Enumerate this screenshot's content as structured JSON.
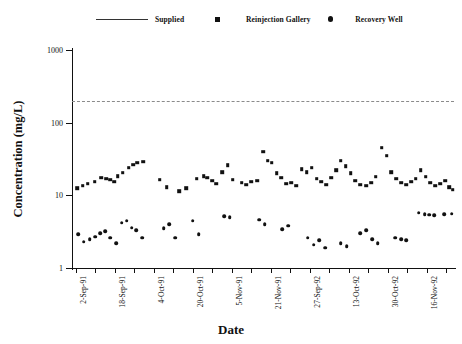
{
  "chart_data": {
    "type": "scatter",
    "title": "",
    "xlabel": "Date",
    "ylabel": "Concentration (mg/L)",
    "yscale": "log",
    "ylim": [
      1,
      1000
    ],
    "ytick_labels": [
      "1000",
      "100",
      "10",
      "1"
    ],
    "ytick_values": [
      1000,
      100,
      10,
      1
    ],
    "grid": false,
    "legend_position": "top",
    "xtick_labels": [
      "2-Sep-91",
      "18-Sep-91",
      "4-Oct-91",
      "20-Oct-91",
      "5-Nov-91",
      "21-Nov-91",
      "27-Sep-92",
      "13-Oct-92",
      "30-Oct-92",
      "16-Nov-92"
    ],
    "xlim_index": [
      0,
      19
    ],
    "annotations": [],
    "series": [
      {
        "name": "Supplied",
        "marker": "line",
        "style": "dashed",
        "color": "#8b8b8b",
        "constant_value": 200
      },
      {
        "name": "Reinjection Gallery",
        "marker": "square",
        "color": "#111111",
        "points": [
          [
            0.05,
            12.5
          ],
          [
            0.35,
            13.5
          ],
          [
            0.6,
            14.5
          ],
          [
            0.95,
            15.5
          ],
          [
            1.3,
            17.5
          ],
          [
            1.55,
            17.0
          ],
          [
            1.75,
            16.5
          ],
          [
            1.95,
            15.5
          ],
          [
            2.15,
            18.5
          ],
          [
            2.4,
            20.5
          ],
          [
            2.7,
            24.0
          ],
          [
            2.95,
            26.5
          ],
          [
            3.15,
            28.0
          ],
          [
            3.45,
            29.0
          ],
          [
            4.3,
            16.5
          ],
          [
            4.65,
            13.0
          ],
          [
            5.3,
            11.5
          ],
          [
            5.65,
            12.5
          ],
          [
            6.2,
            17.0
          ],
          [
            6.55,
            18.5
          ],
          [
            6.75,
            17.5
          ],
          [
            7.0,
            16.0
          ],
          [
            7.2,
            14.5
          ],
          [
            7.5,
            21.0
          ],
          [
            7.8,
            26.0
          ],
          [
            8.05,
            16.5
          ],
          [
            8.5,
            15.0
          ],
          [
            8.75,
            14.0
          ],
          [
            9.0,
            15.5
          ],
          [
            9.3,
            16.0
          ],
          [
            9.6,
            40.0
          ],
          [
            9.85,
            30.0
          ],
          [
            10.05,
            28.0
          ],
          [
            10.3,
            20.0
          ],
          [
            10.55,
            17.5
          ],
          [
            10.8,
            14.5
          ],
          [
            11.05,
            15.0
          ],
          [
            11.3,
            13.5
          ],
          [
            11.6,
            23.0
          ],
          [
            11.85,
            21.0
          ],
          [
            12.1,
            24.0
          ],
          [
            12.35,
            17.0
          ],
          [
            12.6,
            15.5
          ],
          [
            12.85,
            14.0
          ],
          [
            13.1,
            17.5
          ],
          [
            13.35,
            22.0
          ],
          [
            13.6,
            30.0
          ],
          [
            13.85,
            25.0
          ],
          [
            14.1,
            20.0
          ],
          [
            14.35,
            16.0
          ],
          [
            14.6,
            14.0
          ],
          [
            14.9,
            13.5
          ],
          [
            15.15,
            15.0
          ],
          [
            15.4,
            18.0
          ],
          [
            15.7,
            45.0
          ],
          [
            15.95,
            35.0
          ],
          [
            16.2,
            21.0
          ],
          [
            16.45,
            17.0
          ],
          [
            16.7,
            15.0
          ],
          [
            16.95,
            14.0
          ],
          [
            17.2,
            15.5
          ],
          [
            17.45,
            17.0
          ],
          [
            17.7,
            22.0
          ],
          [
            17.95,
            18.0
          ],
          [
            18.2,
            15.0
          ],
          [
            18.45,
            13.5
          ],
          [
            18.7,
            14.5
          ],
          [
            18.95,
            16.0
          ],
          [
            19.15,
            13.0
          ],
          [
            19.35,
            12.0
          ]
        ]
      },
      {
        "name": "Recovery Well",
        "marker": "circle",
        "color": "#111111",
        "points": [
          [
            0.1,
            2.9
          ],
          [
            0.4,
            2.3
          ],
          [
            0.7,
            2.5
          ],
          [
            1.0,
            2.7
          ],
          [
            1.25,
            3.0
          ],
          [
            1.5,
            3.2
          ],
          [
            1.75,
            2.6
          ],
          [
            2.05,
            2.2
          ],
          [
            2.35,
            4.2
          ],
          [
            2.6,
            4.5
          ],
          [
            2.85,
            3.6
          ],
          [
            3.1,
            3.3
          ],
          [
            3.4,
            2.6
          ],
          [
            4.5,
            3.5
          ],
          [
            4.8,
            4.0
          ],
          [
            5.1,
            2.6
          ],
          [
            6.0,
            4.5
          ],
          [
            6.3,
            2.9
          ],
          [
            7.6,
            5.2
          ],
          [
            7.9,
            5.0
          ],
          [
            9.4,
            4.6
          ],
          [
            9.7,
            4.0
          ],
          [
            10.6,
            3.4
          ],
          [
            10.9,
            3.8
          ],
          [
            11.9,
            2.6
          ],
          [
            12.2,
            2.1
          ],
          [
            12.5,
            2.4
          ],
          [
            12.8,
            1.9
          ],
          [
            13.6,
            2.2
          ],
          [
            13.9,
            2.0
          ],
          [
            14.6,
            3.0
          ],
          [
            14.9,
            3.3
          ],
          [
            15.2,
            2.5
          ],
          [
            15.5,
            2.2
          ],
          [
            16.4,
            2.6
          ],
          [
            16.7,
            2.5
          ],
          [
            16.95,
            2.4
          ],
          [
            17.6,
            5.8
          ],
          [
            17.9,
            5.5
          ],
          [
            18.15,
            5.4
          ],
          [
            18.4,
            5.3
          ],
          [
            18.9,
            5.5
          ],
          [
            19.3,
            5.6
          ]
        ]
      }
    ]
  }
}
